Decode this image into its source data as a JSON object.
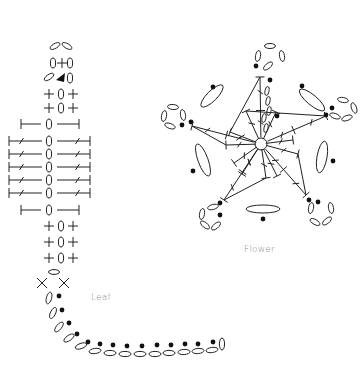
{
  "labels": {
    "leaf": "Leaf",
    "flower": "Flower"
  },
  "colors": {
    "stroke": "#222222",
    "label": "#8a8a8a",
    "background": "#ffffff"
  },
  "legend_symbols": {
    "chain": "oval-icon",
    "slip_stitch": "filled-dot-icon",
    "single_crochet": "plus-icon",
    "half_double": "t-bar-icon",
    "double_crochet": "slashed-t-bar-icon",
    "magic_ring": "circle-icon",
    "start_marker": "triangle-arrow-icon"
  },
  "leaf": {
    "center_x": 61,
    "top_chains": [
      {
        "x": 55,
        "y": 46,
        "rot": -30
      },
      {
        "x": 67,
        "y": 46,
        "rot": 30
      }
    ],
    "tip_row": {
      "y": 63,
      "left": "0",
      "mid": "+",
      "right": "0"
    },
    "arrow_row": {
      "y": 78
    },
    "sc_rows_top": [
      {
        "y": 94
      },
      {
        "y": 108
      }
    ],
    "hdc_rows": [
      {
        "y": 124
      },
      {
        "y": 210
      }
    ],
    "dc_rows": [
      {
        "y": 141
      },
      {
        "y": 154
      },
      {
        "y": 167
      },
      {
        "y": 180
      },
      {
        "y": 193
      }
    ],
    "sc_rows_bottom": [
      {
        "y": 226
      },
      {
        "y": 242
      },
      {
        "y": 258
      }
    ],
    "chain_oval_bottom": {
      "x": 54,
      "y": 272
    },
    "x_marks": [
      {
        "x": 42,
        "y": 283
      },
      {
        "x": 64,
        "y": 283
      }
    ],
    "stem_chains": [
      {
        "x": 49,
        "y": 298,
        "rot": -75
      },
      {
        "x": 53,
        "y": 313,
        "rot": -65
      },
      {
        "x": 59,
        "y": 327,
        "rot": -50
      },
      {
        "x": 69,
        "y": 338,
        "rot": -35
      },
      {
        "x": 81,
        "y": 346,
        "rot": -20
      },
      {
        "x": 95,
        "y": 351,
        "rot": -8
      },
      {
        "x": 110,
        "y": 353,
        "rot": 0
      },
      {
        "x": 125,
        "y": 354,
        "rot": 0
      },
      {
        "x": 140,
        "y": 354,
        "rot": 0
      },
      {
        "x": 155,
        "y": 354,
        "rot": 0
      },
      {
        "x": 169,
        "y": 353,
        "rot": 0
      },
      {
        "x": 184,
        "y": 352,
        "rot": -3
      },
      {
        "x": 198,
        "y": 351,
        "rot": -5
      },
      {
        "x": 212,
        "y": 350,
        "rot": -8
      },
      {
        "x": 222,
        "y": 344,
        "rot": -90
      }
    ],
    "stem_dots": [
      {
        "x": 59,
        "y": 296
      },
      {
        "x": 62,
        "y": 310
      },
      {
        "x": 69,
        "y": 323
      },
      {
        "x": 77,
        "y": 334
      },
      {
        "x": 88,
        "y": 342
      },
      {
        "x": 100,
        "y": 344
      },
      {
        "x": 113,
        "y": 345
      },
      {
        "x": 127,
        "y": 346
      },
      {
        "x": 142,
        "y": 346
      },
      {
        "x": 157,
        "y": 345
      },
      {
        "x": 171,
        "y": 345
      },
      {
        "x": 185,
        "y": 344
      },
      {
        "x": 198,
        "y": 344
      },
      {
        "x": 213,
        "y": 342
      }
    ]
  },
  "flower": {
    "center": {
      "x": 261,
      "y": 144,
      "r": 6
    },
    "petal_tips": [
      {
        "x": 260,
        "y": 77
      },
      {
        "x": 326,
        "y": 116
      },
      {
        "x": 306,
        "y": 195
      },
      {
        "x": 224,
        "y": 200
      },
      {
        "x": 192,
        "y": 126
      }
    ],
    "inner_spokes": [
      {
        "x": 246,
        "y": 111
      },
      {
        "x": 276,
        "y": 112
      },
      {
        "x": 293,
        "y": 140
      },
      {
        "x": 298,
        "y": 154
      },
      {
        "x": 277,
        "y": 176
      },
      {
        "x": 266,
        "y": 178
      },
      {
        "x": 242,
        "y": 174
      },
      {
        "x": 234,
        "y": 163
      },
      {
        "x": 230,
        "y": 132
      },
      {
        "x": 226,
        "y": 145
      }
    ],
    "picots": [
      {
        "cx": 270,
        "cy": 56,
        "chains": [
          {
            "x": 258,
            "y": 56,
            "rot": -80
          },
          {
            "x": 270,
            "y": 46,
            "rot": 0
          },
          {
            "x": 282,
            "y": 56,
            "rot": 80
          },
          {
            "x": 268,
            "y": 66,
            "rot": -40
          }
        ],
        "dots": [
          {
            "x": 256,
            "y": 66
          },
          {
            "x": 270,
            "y": 80
          }
        ]
      },
      {
        "cx": 345,
        "cy": 107,
        "chains": [
          {
            "x": 343,
            "y": 100,
            "rot": 10
          },
          {
            "x": 354,
            "y": 108,
            "rot": 70
          },
          {
            "x": 347,
            "y": 118,
            "rot": -20
          },
          {
            "x": 335,
            "y": 116,
            "rot": 20
          }
        ],
        "dots": [
          {
            "x": 332,
            "y": 108
          },
          {
            "x": 326,
            "y": 115
          }
        ]
      },
      {
        "cx": 323,
        "cy": 213,
        "chains": [
          {
            "x": 311,
            "y": 208,
            "rot": -80
          },
          {
            "x": 315,
            "y": 222,
            "rot": 30
          },
          {
            "x": 327,
            "y": 221,
            "rot": -40
          },
          {
            "x": 331,
            "y": 208,
            "rot": 80
          }
        ],
        "dots": [
          {
            "x": 309,
            "y": 200
          },
          {
            "x": 318,
            "y": 202
          }
        ]
      },
      {
        "cx": 210,
        "cy": 215,
        "chains": [
          {
            "x": 213,
            "y": 207,
            "rot": -15
          },
          {
            "x": 202,
            "y": 214,
            "rot": -80
          },
          {
            "x": 205,
            "y": 225,
            "rot": 40
          },
          {
            "x": 216,
            "y": 226,
            "rot": -40
          }
        ],
        "dots": [
          {
            "x": 220,
            "y": 203
          },
          {
            "x": 220,
            "y": 215
          }
        ]
      },
      {
        "cx": 172,
        "cy": 115,
        "chains": [
          {
            "x": 173,
            "y": 107,
            "rot": 5
          },
          {
            "x": 164,
            "y": 116,
            "rot": -80
          },
          {
            "x": 170,
            "y": 126,
            "rot": 20
          },
          {
            "x": 183,
            "y": 115,
            "rot": 80
          }
        ],
        "dots": [
          {
            "x": 182,
            "y": 125
          },
          {
            "x": 191,
            "y": 122
          }
        ]
      }
    ],
    "long_chains": [
      {
        "x": 212,
        "y": 96,
        "rx": 15,
        "ry": 5,
        "rot": -45,
        "dot": {
          "x": 213,
          "y": 87
        }
      },
      {
        "x": 312,
        "y": 100,
        "rx": 16,
        "ry": 5,
        "rot": 40,
        "dot": {
          "x": 302,
          "y": 86
        }
      },
      {
        "x": 322,
        "y": 157,
        "rx": 16,
        "ry": 5,
        "rot": -80,
        "dot": {
          "x": 333,
          "y": 161
        }
      },
      {
        "x": 263,
        "y": 209,
        "rx": 17,
        "ry": 4,
        "rot": 0,
        "dot": {
          "x": 263,
          "y": 219
        }
      },
      {
        "x": 203,
        "y": 160,
        "rx": 17,
        "ry": 5,
        "rot": 70,
        "dot": {
          "x": 193,
          "y": 171
        }
      }
    ],
    "center_chain_stack": [
      {
        "x": 267,
        "y": 91
      },
      {
        "x": 268,
        "y": 101
      },
      {
        "x": 269,
        "y": 111
      },
      {
        "x": 264,
        "y": 118
      },
      {
        "x": 266,
        "y": 128
      }
    ],
    "center_dot": {
      "x": 277,
      "y": 116
    }
  }
}
